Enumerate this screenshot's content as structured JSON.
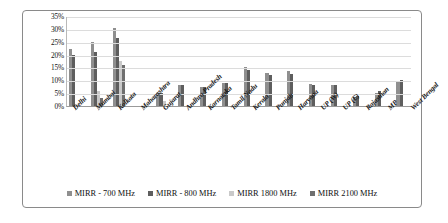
{
  "chart_data": {
    "type": "bar",
    "title": "",
    "xlabel": "",
    "ylabel": "",
    "ylim": [
      0,
      35
    ],
    "ytick_labels": [
      "0%",
      "5%",
      "10%",
      "15%",
      "20%",
      "25%",
      "30%",
      "35%"
    ],
    "ytick_values": [
      0,
      5,
      10,
      15,
      20,
      25,
      30,
      35
    ],
    "grid": true,
    "legend_position": "bottom",
    "categories": [
      "Delhi",
      "Mumbai",
      "Kolkata",
      "Maharashtra",
      "Gujarat",
      "Andhra Pradesh",
      "Karnataka",
      "Tamil Nadu",
      "Kerala",
      "Punjab",
      "Haryana",
      "UP (W)",
      "UP (E)",
      "Rajasthan",
      "MP",
      "West Bengal"
    ],
    "series": [
      {
        "name": "MIRR - 700 MHz",
        "color": "#8f8f8f",
        "values": [
          22.0,
          25.0,
          30.5,
          0.0,
          5.0,
          8.0,
          7.5,
          9.0,
          15.0,
          13.0,
          13.5,
          8.5,
          8.0,
          3.5,
          5.0,
          9.5
        ]
      },
      {
        "name": "MIRR - 800 MHz",
        "color": "#5e5e5e",
        "values": [
          20.0,
          21.0,
          26.5,
          0.0,
          5.0,
          8.0,
          7.5,
          9.0,
          14.0,
          12.0,
          12.5,
          8.0,
          8.0,
          4.0,
          6.0,
          10.0
        ]
      },
      {
        "name": "MIRR 1800 MHz",
        "color": "#c9c9c9",
        "values": [
          0.0,
          6.0,
          17.5,
          0.0,
          2.0,
          0.0,
          0.0,
          0.0,
          0.0,
          0.0,
          0.0,
          0.0,
          0.0,
          0.0,
          0.0,
          0.0
        ]
      },
      {
        "name": "MIRR 2100 MHz",
        "color": "#6f6f6f",
        "values": [
          0.0,
          3.0,
          16.0,
          0.0,
          0.0,
          0.0,
          0.0,
          0.0,
          0.0,
          0.0,
          0.0,
          0.0,
          0.0,
          0.0,
          0.0,
          0.0
        ]
      }
    ]
  }
}
